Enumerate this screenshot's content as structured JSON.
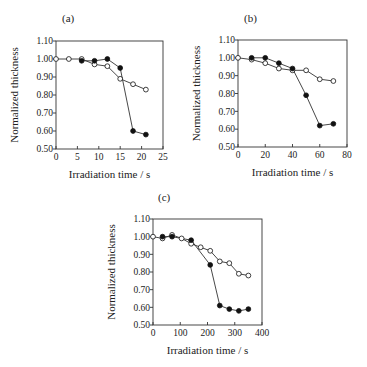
{
  "figure": {
    "background": "#ffffff",
    "line_color": "#333333"
  },
  "chart_data": [
    {
      "type": "line",
      "panel": "(a)",
      "xlabel": "Irradiation time / s",
      "ylabel": "Normalized thickness",
      "xlim": [
        0,
        25
      ],
      "ylim": [
        0.5,
        1.1
      ],
      "xticks": [
        0,
        5,
        10,
        15,
        20,
        25
      ],
      "yticks": [
        0.5,
        0.6,
        0.7,
        0.8,
        0.9,
        1.0,
        1.1
      ],
      "ytick_labels": [
        "0.50",
        "0.60",
        "0.70",
        "0.80",
        "0.90",
        "1.00",
        "1.10"
      ],
      "grid": false,
      "series": [
        {
          "name": "open circles",
          "marker": "open-circle",
          "x": [
            0,
            3,
            6,
            9,
            12,
            15,
            18,
            21
          ],
          "y": [
            1.0,
            1.0,
            1.0,
            0.97,
            0.96,
            0.89,
            0.86,
            0.83
          ]
        },
        {
          "name": "filled circles",
          "marker": "filled-circle",
          "x": [
            6,
            9,
            12,
            15,
            18,
            21
          ],
          "y": [
            0.99,
            0.99,
            1.0,
            0.95,
            0.6,
            0.58
          ]
        }
      ]
    },
    {
      "type": "line",
      "panel": "(b)",
      "xlabel": "Irradiation time / s",
      "ylabel": "Normalized thickness",
      "xlim": [
        0,
        80
      ],
      "ylim": [
        0.5,
        1.1
      ],
      "xticks": [
        0,
        20,
        40,
        60,
        80
      ],
      "yticks": [
        0.5,
        0.6,
        0.7,
        0.8,
        0.9,
        1.0,
        1.1
      ],
      "ytick_labels": [
        "0.50",
        "0.60",
        "0.70",
        "0.80",
        "0.90",
        "1.00",
        "1.10"
      ],
      "grid": false,
      "series": [
        {
          "name": "open circles",
          "marker": "open-circle",
          "x": [
            0,
            10,
            20,
            30,
            40,
            50,
            60,
            70
          ],
          "y": [
            1.0,
            0.99,
            0.97,
            0.94,
            0.93,
            0.93,
            0.88,
            0.87
          ]
        },
        {
          "name": "filled circles",
          "marker": "filled-circle",
          "x": [
            10,
            20,
            30,
            40,
            50,
            60,
            70
          ],
          "y": [
            1.0,
            1.0,
            0.97,
            0.94,
            0.79,
            0.62,
            0.63
          ]
        }
      ]
    },
    {
      "type": "line",
      "panel": "(c)",
      "xlabel": "Irradiation time / s",
      "ylabel": "Normalized thickness",
      "xlim": [
        0,
        400
      ],
      "ylim": [
        0.5,
        1.1
      ],
      "xticks": [
        0,
        100,
        200,
        300,
        400
      ],
      "yticks": [
        0.5,
        0.6,
        0.7,
        0.8,
        0.9,
        1.0,
        1.1
      ],
      "ytick_labels": [
        "0.50",
        "0.60",
        "0.70",
        "0.80",
        "0.90",
        "1.00",
        "1.10"
      ],
      "grid": false,
      "series": [
        {
          "name": "open circles",
          "marker": "open-circle",
          "x": [
            0,
            35,
            70,
            105,
            140,
            175,
            210,
            245,
            280,
            315,
            350
          ],
          "y": [
            1.0,
            0.99,
            1.01,
            0.99,
            0.96,
            0.94,
            0.92,
            0.86,
            0.85,
            0.79,
            0.78
          ]
        },
        {
          "name": "filled circles",
          "marker": "filled-circle",
          "x": [
            35,
            70,
            140,
            210,
            245,
            280,
            315,
            350
          ],
          "y": [
            1.0,
            1.0,
            0.98,
            0.84,
            0.61,
            0.59,
            0.58,
            0.59
          ]
        }
      ]
    }
  ],
  "layout": {
    "panels": [
      {
        "left": 56,
        "right": 163,
        "top": 41,
        "bottom": 149,
        "label_x": 62,
        "label_y": 22
      },
      {
        "left": 238,
        "right": 347,
        "top": 40,
        "bottom": 147,
        "label_x": 244,
        "label_y": 22
      },
      {
        "left": 153,
        "right": 262,
        "top": 219,
        "bottom": 325,
        "label_x": 158,
        "label_y": 201
      }
    ]
  }
}
